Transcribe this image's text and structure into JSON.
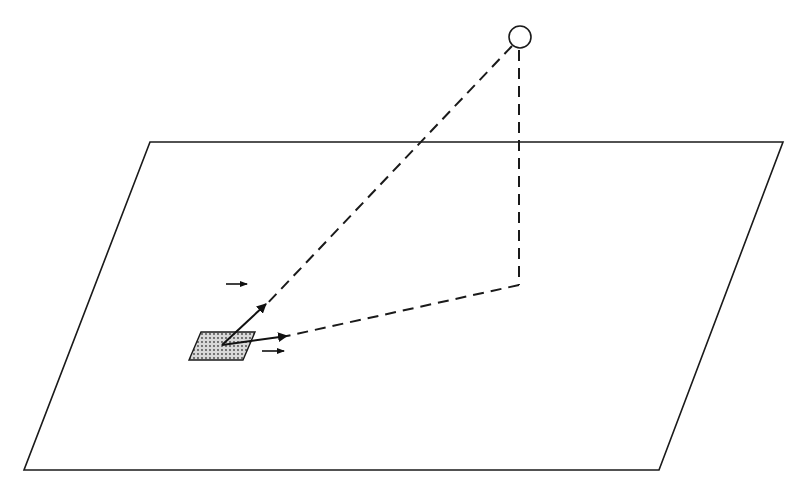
{
  "diagram": {
    "colors": {
      "stroke": "#1a1a1a",
      "background": "#ffffff",
      "patch_fill": "#d0d0d0",
      "patch_dots": "#555555"
    },
    "plane": {
      "points": [
        [
          150,
          142
        ],
        [
          783,
          142
        ],
        [
          659,
          470
        ],
        [
          24,
          470
        ]
      ]
    },
    "light_source": {
      "cx": 520,
      "cy": 37,
      "r": 11
    },
    "patch": {
      "points": [
        [
          189,
          360
        ],
        [
          201,
          332
        ],
        [
          255,
          332
        ],
        [
          243,
          360
        ]
      ],
      "center": [
        222,
        345
      ]
    },
    "dashed_lines": [
      {
        "name": "incident-ray",
        "from": [
          512,
          46
        ],
        "to": [
          264,
          307
        ]
      },
      {
        "name": "vertical-drop",
        "from": [
          519,
          50
        ],
        "to": [
          519,
          285
        ]
      },
      {
        "name": "reflected-ray",
        "from": [
          519,
          285
        ],
        "to": [
          287,
          336
        ]
      }
    ],
    "vectors": [
      {
        "name": "toward-source-vector",
        "from": [
          222,
          345
        ],
        "to": [
          266,
          304
        ]
      },
      {
        "name": "toward-projection-vector",
        "from": [
          222,
          345
        ],
        "to": [
          287,
          336
        ]
      }
    ],
    "small_arrows": [
      {
        "name": "direction-arrow-upper",
        "from": [
          226,
          284
        ],
        "to": [
          247,
          284
        ]
      },
      {
        "name": "direction-arrow-lower",
        "from": [
          262,
          351
        ],
        "to": [
          284,
          351
        ]
      }
    ]
  }
}
